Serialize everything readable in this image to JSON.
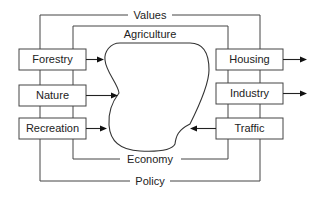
{
  "diagram": {
    "frame_labels": {
      "top_outer": "Values",
      "top_inner": "Agriculture",
      "bottom_inner": "Economy",
      "bottom_outer": "Policy"
    },
    "left_boxes": [
      {
        "id": "forestry",
        "label": "Forestry",
        "arrow": "into-center"
      },
      {
        "id": "nature",
        "label": "Nature",
        "arrow": "into-center"
      },
      {
        "id": "recreation",
        "label": "Recreation",
        "arrow": "into-center"
      }
    ],
    "right_boxes": [
      {
        "id": "housing",
        "label": "Housing",
        "arrow": "outward"
      },
      {
        "id": "industry",
        "label": "Industry",
        "arrow": "outward"
      },
      {
        "id": "traffic",
        "label": "Traffic",
        "arrow": "into-center"
      }
    ],
    "center_region": "Agriculture"
  }
}
